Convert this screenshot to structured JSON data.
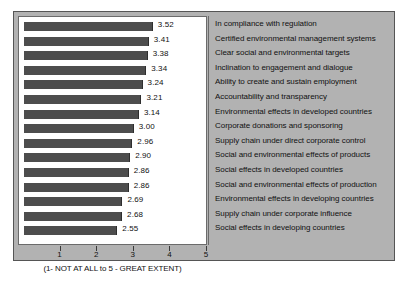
{
  "chart_data": {
    "type": "bar",
    "orientation": "horizontal",
    "title": "",
    "subtitle": "",
    "xlabel": "(1- NOT AT ALL to 5 - GREAT EXTENT)",
    "ylabel": "",
    "xlim": [
      0,
      5
    ],
    "xticks": [
      "1",
      "2",
      "3",
      "4",
      "5"
    ],
    "grid": false,
    "legend": "none",
    "bar_color": "#4d4d4d",
    "panel_color": "#b2b2b2",
    "plot_background": "#ffffff",
    "categories": [
      "In compliance with regulation",
      "Certified environmental management systems",
      "Clear social and environmental targets",
      "Inclination to engagement and dialogue",
      "Ability to create and sustain employment",
      "Accountability and transparency",
      "Environmental effects in developed countries",
      "Corporate donations and sponsoring",
      "Supply chain under direct corporate control",
      "Social and environmental effects of products",
      "Social effects in developed countries",
      "Social and environmental effects of production",
      "Environmental effects in developing countries",
      "Supply chain under corporate influence",
      "Social effects in developing countries"
    ],
    "values": [
      3.52,
      3.41,
      3.38,
      3.34,
      3.24,
      3.21,
      3.14,
      3.0,
      2.96,
      2.9,
      2.86,
      2.86,
      2.69,
      2.68,
      2.55
    ],
    "value_labels": [
      "3.52",
      "3.41",
      "3.38",
      "3.34",
      "3.24",
      "3.21",
      "3.14",
      "3.00",
      "2.96",
      "2.90",
      "2.86",
      "2.86",
      "2.69",
      "2.68",
      "2.55"
    ]
  }
}
